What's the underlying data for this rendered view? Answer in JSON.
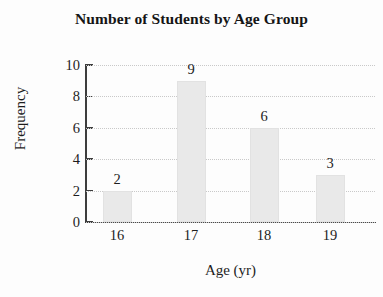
{
  "chart_data": {
    "type": "bar",
    "title": "Number of Students by Age Group",
    "xlabel": "Age (yr)",
    "ylabel": "Frequency",
    "categories": [
      "16",
      "17",
      "18",
      "19"
    ],
    "values": [
      2,
      9,
      6,
      3
    ],
    "value_labels": [
      "2",
      "9",
      "6",
      "3"
    ],
    "ylim": [
      0,
      10
    ],
    "yticks": [
      0,
      2,
      4,
      6,
      8,
      10
    ],
    "ytick_labels": [
      "0",
      "2",
      "4",
      "6",
      "8",
      "10"
    ],
    "grid": true,
    "grid_style": "dotted",
    "legend": null,
    "bar_color": "#e9e9e9",
    "axis_color": "#3d3d3d",
    "grid_color": "#c9c9c9",
    "text_color": "#1d1d1d",
    "background": "#fdfdfd"
  }
}
